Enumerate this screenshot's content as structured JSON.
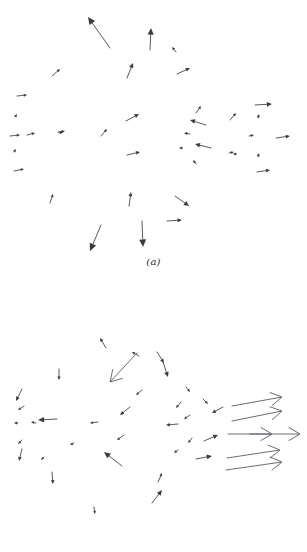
{
  "figure": {
    "background_color": "#ffffff",
    "vector_color": "#3a3a42",
    "long_vector_color": "#5a5a64",
    "width": 307,
    "height": 552
  },
  "panels": [
    {
      "id": "a",
      "caption": "(a)"
    },
    {
      "id": "b",
      "caption": "(b)"
    }
  ],
  "chart_data": {
    "type": "scatter",
    "title": "",
    "subtitle": "",
    "xlabel": "",
    "ylabel": "",
    "grid": false,
    "legend": null,
    "annotations": [
      "(a)",
      "(b)"
    ],
    "panels": [
      {
        "id": "a",
        "label": "(a)",
        "xlim": [
          0,
          307
        ],
        "ylim": [
          0,
          252
        ],
        "arrow_head": "solid-triangle",
        "count": 38,
        "vectors": [
          {
            "x": 110,
            "y": 48,
            "x2": 88,
            "y2": 17,
            "dx": -22,
            "dy": -31
          },
          {
            "x": 150,
            "y": 50,
            "x2": 151,
            "y2": 28,
            "dx": 1,
            "dy": -22
          },
          {
            "x": 176,
            "y": 52,
            "x2": 172,
            "y2": 47,
            "dx": -4,
            "dy": -5
          },
          {
            "x": 127,
            "y": 78,
            "x2": 133,
            "y2": 63,
            "dx": 6,
            "dy": -15
          },
          {
            "x": 177,
            "y": 74,
            "x2": 190,
            "y2": 68,
            "dx": 13,
            "dy": -6
          },
          {
            "x": 52,
            "y": 76,
            "x2": 60,
            "y2": 69,
            "dx": 8,
            "dy": -7
          },
          {
            "x": 17,
            "y": 96,
            "x2": 27,
            "y2": 95,
            "dx": 10,
            "dy": -1
          },
          {
            "x": 15,
            "y": 117,
            "x2": 17,
            "y2": 114,
            "dx": 2,
            "dy": -3
          },
          {
            "x": 10,
            "y": 136,
            "x2": 20,
            "y2": 135,
            "dx": 10,
            "dy": -1
          },
          {
            "x": 27,
            "y": 135,
            "x2": 35,
            "y2": 133,
            "dx": 8,
            "dy": -2
          },
          {
            "x": 58,
            "y": 132,
            "x2": 65,
            "y2": 131,
            "dx": 7,
            "dy": -1
          },
          {
            "x": 101,
            "y": 136,
            "x2": 107,
            "y2": 129,
            "dx": 6,
            "dy": -7
          },
          {
            "x": 126,
            "y": 121,
            "x2": 139,
            "y2": 114,
            "dx": 13,
            "dy": -7
          },
          {
            "x": 127,
            "y": 155,
            "x2": 140,
            "y2": 152,
            "dx": 13,
            "dy": -3
          },
          {
            "x": 14,
            "y": 152,
            "x2": 16,
            "y2": 149,
            "dx": 2,
            "dy": -3
          },
          {
            "x": 14,
            "y": 171,
            "x2": 24,
            "y2": 169,
            "dx": 10,
            "dy": -2
          },
          {
            "x": 196,
            "y": 113,
            "x2": 201,
            "y2": 106,
            "dx": 5,
            "dy": -7
          },
          {
            "x": 206,
            "y": 125,
            "x2": 190,
            "y2": 120,
            "dx": -16,
            "dy": -5
          },
          {
            "x": 230,
            "y": 120,
            "x2": 236,
            "y2": 113,
            "dx": 6,
            "dy": -7
          },
          {
            "x": 190,
            "y": 134,
            "x2": 184,
            "y2": 133,
            "dx": -6,
            "dy": -1
          },
          {
            "x": 211,
            "y": 148,
            "x2": 195,
            "y2": 144,
            "dx": -16,
            "dy": -4
          },
          {
            "x": 229,
            "y": 153,
            "x2": 234,
            "y2": 152,
            "dx": 5,
            "dy": -1
          },
          {
            "x": 196,
            "y": 164,
            "x2": 193,
            "y2": 160,
            "dx": -3,
            "dy": -4
          },
          {
            "x": 255,
            "y": 105,
            "x2": 272,
            "y2": 104,
            "dx": 17,
            "dy": -1
          },
          {
            "x": 258,
            "y": 118,
            "x2": 259,
            "y2": 114,
            "dx": 1,
            "dy": -4
          },
          {
            "x": 249,
            "y": 136,
            "x2": 254,
            "y2": 135,
            "dx": 5,
            "dy": -1
          },
          {
            "x": 276,
            "y": 138,
            "x2": 290,
            "y2": 136,
            "dx": 14,
            "dy": -2
          },
          {
            "x": 258,
            "y": 157,
            "x2": 259,
            "y2": 153,
            "dx": 1,
            "dy": -4
          },
          {
            "x": 257,
            "y": 172,
            "x2": 270,
            "y2": 170,
            "dx": 13,
            "dy": -2
          },
          {
            "x": 50,
            "y": 203,
            "x2": 53,
            "y2": 194,
            "dx": 3,
            "dy": -9
          },
          {
            "x": 129,
            "y": 206,
            "x2": 131,
            "y2": 192,
            "dx": 2,
            "dy": -14
          },
          {
            "x": 175,
            "y": 196,
            "x2": 189,
            "y2": 206,
            "dx": 14,
            "dy": 10
          },
          {
            "x": 167,
            "y": 221,
            "x2": 182,
            "y2": 220,
            "dx": 15,
            "dy": -1
          },
          {
            "x": 101,
            "y": 225,
            "x2": 90,
            "y2": 251,
            "dx": -11,
            "dy": 26
          },
          {
            "x": 142,
            "y": 221,
            "x2": 143,
            "y2": 247,
            "dx": 1,
            "dy": 26
          },
          {
            "x": 182,
            "y": 148,
            "x2": 179,
            "y2": 148,
            "dx": -3,
            "dy": 0
          },
          {
            "x": 235,
            "y": 154,
            "x2": 233,
            "y2": 154,
            "dx": -2,
            "dy": 0
          },
          {
            "x": 59,
            "y": 133,
            "x2": 63,
            "y2": 132,
            "dx": 4,
            "dy": -1
          }
        ]
      },
      {
        "id": "b",
        "label": "(b)",
        "xlim": [
          0,
          307
        ],
        "ylim": [
          0,
          238
        ],
        "arrow_head": "open-v",
        "count": 40,
        "vectors": [
          {
            "x": 106,
            "y": 68,
            "x2": 100,
            "y2": 58,
            "dx": -6,
            "dy": -10
          },
          {
            "x": 139,
            "y": 76,
            "x2": 132,
            "y2": 72,
            "dx": -7,
            "dy": -4
          },
          {
            "x": 137,
            "y": 73,
            "x2": 110,
            "y2": 102,
            "dx": -27,
            "dy": 29
          },
          {
            "x": 157,
            "y": 72,
            "x2": 164,
            "y2": 83,
            "dx": 7,
            "dy": 11
          },
          {
            "x": 163,
            "y": 82,
            "x2": 168,
            "y2": 97,
            "dx": 5,
            "dy": 15
          },
          {
            "x": 59,
            "y": 89,
            "x2": 59,
            "y2": 100,
            "dx": 0,
            "dy": 11
          },
          {
            "x": 22,
            "y": 109,
            "x2": 16,
            "y2": 121,
            "dx": -6,
            "dy": 12
          },
          {
            "x": 24,
            "y": 126,
            "x2": 18,
            "y2": 130,
            "dx": -6,
            "dy": 4
          },
          {
            "x": 18,
            "y": 143,
            "x2": 14,
            "y2": 143,
            "dx": -4,
            "dy": 0
          },
          {
            "x": 36,
            "y": 143,
            "x2": 31,
            "y2": 142,
            "dx": -5,
            "dy": -1
          },
          {
            "x": 57,
            "y": 139,
            "x2": 38,
            "y2": 140,
            "dx": -19,
            "dy": 1
          },
          {
            "x": 22,
            "y": 160,
            "x2": 18,
            "y2": 164,
            "dx": -4,
            "dy": 4
          },
          {
            "x": 22,
            "y": 169,
            "x2": 19,
            "y2": 181,
            "dx": -3,
            "dy": 12
          },
          {
            "x": 98,
            "y": 142,
            "x2": 90,
            "y2": 143,
            "dx": -8,
            "dy": 1
          },
          {
            "x": 130,
            "y": 127,
            "x2": 120,
            "y2": 135,
            "dx": -10,
            "dy": 8
          },
          {
            "x": 124,
            "y": 155,
            "x2": 117,
            "y2": 160,
            "dx": -7,
            "dy": 5
          },
          {
            "x": 181,
            "y": 122,
            "x2": 176,
            "y2": 128,
            "dx": -5,
            "dy": 6
          },
          {
            "x": 190,
            "y": 135,
            "x2": 184,
            "y2": 139,
            "dx": -6,
            "dy": 4
          },
          {
            "x": 178,
            "y": 144,
            "x2": 166,
            "y2": 145,
            "dx": -12,
            "dy": 1
          },
          {
            "x": 192,
            "y": 158,
            "x2": 188,
            "y2": 163,
            "dx": -4,
            "dy": 5
          },
          {
            "x": 178,
            "y": 170,
            "x2": 174,
            "y2": 173,
            "dx": -4,
            "dy": 3
          },
          {
            "x": 223,
            "y": 127,
            "x2": 212,
            "y2": 133,
            "dx": -11,
            "dy": 6
          },
          {
            "x": 52,
            "y": 192,
            "x2": 53,
            "y2": 204,
            "dx": 1,
            "dy": 12
          },
          {
            "x": 122,
            "y": 186,
            "x2": 104,
            "y2": 172,
            "dx": -18,
            "dy": -14
          },
          {
            "x": 94,
            "y": 227,
            "x2": 95,
            "y2": 234,
            "dx": 1,
            "dy": 7
          },
          {
            "x": 158,
            "y": 202,
            "x2": 162,
            "y2": 193,
            "dx": 4,
            "dy": -9
          },
          {
            "x": 152,
            "y": 223,
            "x2": 162,
            "y2": 210,
            "dx": 10,
            "dy": -13
          },
          {
            "x": 204,
            "y": 161,
            "x2": 218,
            "y2": 155,
            "dx": 14,
            "dy": -6
          },
          {
            "x": 196,
            "y": 179,
            "x2": 212,
            "y2": 176,
            "dx": 16,
            "dy": -3
          },
          {
            "x": 232,
            "y": 126,
            "x2": 282,
            "y2": 117,
            "dx": 50,
            "dy": -9
          },
          {
            "x": 232,
            "y": 141,
            "x2": 282,
            "y2": 131,
            "dx": 50,
            "dy": -10
          },
          {
            "x": 228,
            "y": 154,
            "x2": 272,
            "y2": 154,
            "dx": 44,
            "dy": 0
          },
          {
            "x": 250,
            "y": 154,
            "x2": 300,
            "y2": 154,
            "dx": 50,
            "dy": 0
          },
          {
            "x": 227,
            "y": 178,
            "x2": 280,
            "y2": 170,
            "dx": 53,
            "dy": -8
          },
          {
            "x": 226,
            "y": 190,
            "x2": 282,
            "y2": 182,
            "dx": 56,
            "dy": -8
          },
          {
            "x": 203,
            "y": 119,
            "x2": 208,
            "y2": 124,
            "dx": 5,
            "dy": 5
          },
          {
            "x": 186,
            "y": 107,
            "x2": 190,
            "y2": 112,
            "dx": 4,
            "dy": 5
          },
          {
            "x": 142,
            "y": 110,
            "x2": 136,
            "y2": 115,
            "dx": -6,
            "dy": 5
          },
          {
            "x": 74,
            "y": 163,
            "x2": 70,
            "y2": 165,
            "dx": -4,
            "dy": 2
          },
          {
            "x": 44,
            "y": 177,
            "x2": 41,
            "y2": 180,
            "dx": -3,
            "dy": 3
          }
        ]
      }
    ]
  }
}
